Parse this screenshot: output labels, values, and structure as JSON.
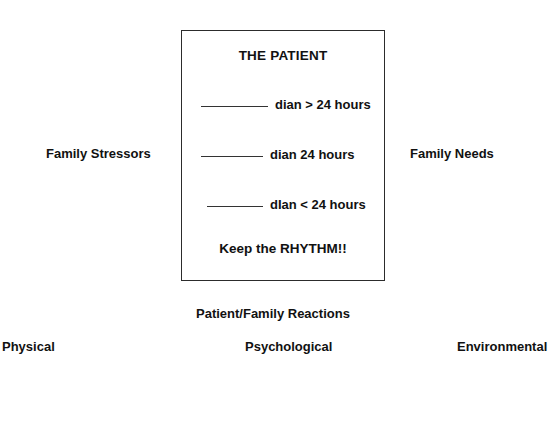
{
  "diagram": {
    "box": {
      "title": "THE PATIENT",
      "rows": [
        {
          "blank": "________",
          "text": "dian > 24 hours"
        },
        {
          "blank": "________",
          "text": "dian 24 hours"
        },
        {
          "blank": "_______",
          "text": "dIan < 24 hours"
        }
      ],
      "footer": "Keep the RHYTHM!!"
    },
    "labels": {
      "left_middle": "Family Stressors",
      "right_middle": "Family Needs",
      "below_box": "Patient/Family Reactions",
      "bottom_left": "Physical",
      "bottom_center": "Psychological",
      "bottom_right": "Environmental"
    },
    "colors": {
      "background": "#ffffff",
      "text": "#111111",
      "border": "#2c2c2c",
      "rule": "#333333"
    }
  }
}
